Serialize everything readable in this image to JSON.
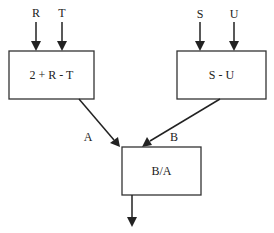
{
  "diagram": {
    "inputs": {
      "r": "R",
      "t": "T",
      "s": "S",
      "u": "U"
    },
    "boxes": {
      "left": "2 + R - T",
      "right": "S - U",
      "bottom": "B/A"
    },
    "edges": {
      "a": "A",
      "b": "B"
    },
    "colors": {
      "stroke": "#222222",
      "background": "#ffffff"
    }
  }
}
